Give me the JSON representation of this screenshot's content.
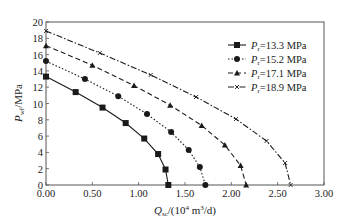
{
  "chart_data": {
    "type": "line",
    "title": "",
    "xlabel": "Q_sc /(10^4 m^3/d)",
    "xlabel_parts": {
      "main": "Q",
      "sub": "sc",
      "rest": "/(10",
      "sup1": "4",
      "mid": " m",
      "sup2": "3",
      "end": "/d)"
    },
    "ylabel": "P_wf /MPa",
    "ylabel_parts": {
      "main": "P",
      "sub": "wf",
      "rest": "/MPa"
    },
    "xlim": [
      0,
      3.0
    ],
    "ylim": [
      0,
      20
    ],
    "xticks": [
      "0.00",
      "0.50",
      "1.00",
      "1.50",
      "2.00",
      "2.50",
      "3.00"
    ],
    "xtick_values": [
      0,
      0.5,
      1.0,
      1.5,
      2.0,
      2.5,
      3.0
    ],
    "yticks": [
      "0",
      "2",
      "4",
      "6",
      "8",
      "10",
      "12",
      "14",
      "16",
      "18",
      "20"
    ],
    "ytick_values": [
      0,
      2,
      4,
      6,
      8,
      10,
      12,
      14,
      16,
      18,
      20
    ],
    "grid": false,
    "legend_position": "upper right",
    "series": [
      {
        "name": "P_r=13.3 MPa",
        "label_main": "P",
        "label_sub": "r",
        "label_rest": "=13.3 MPa",
        "marker": "square",
        "dash": "",
        "x": [
          0.0,
          0.32,
          0.61,
          0.86,
          1.06,
          1.21,
          1.29,
          1.32
        ],
        "y": [
          13.3,
          11.4,
          9.5,
          7.6,
          5.7,
          3.8,
          1.9,
          0.0
        ]
      },
      {
        "name": "P_r=15.2 MPa",
        "label_main": "P",
        "label_sub": "r",
        "label_rest": "=15.2 MPa",
        "marker": "circle",
        "dash": "1.5,2",
        "x": [
          0.0,
          0.42,
          0.78,
          1.09,
          1.35,
          1.54,
          1.66,
          1.72
        ],
        "y": [
          15.2,
          13.0,
          10.9,
          8.7,
          6.5,
          4.3,
          2.2,
          0.0
        ]
      },
      {
        "name": "P_r=17.1 MPa",
        "label_main": "P",
        "label_sub": "r",
        "label_rest": "=17.1 MPa",
        "marker": "triangle",
        "dash": "5,3",
        "x": [
          0.0,
          0.5,
          0.95,
          1.34,
          1.68,
          1.93,
          2.1,
          2.16
        ],
        "y": [
          17.1,
          14.7,
          12.2,
          9.8,
          7.3,
          4.9,
          2.4,
          0.0
        ]
      },
      {
        "name": "P_r=18.9 MPa",
        "label_main": "P",
        "label_sub": "r",
        "label_rest": "=18.9 MPa",
        "marker": "x",
        "dash": "6,2,1.5,2",
        "x": [
          0.0,
          0.58,
          1.13,
          1.62,
          2.05,
          2.38,
          2.58,
          2.64
        ],
        "y": [
          18.9,
          16.2,
          13.5,
          10.8,
          8.1,
          5.4,
          2.7,
          0.0
        ]
      }
    ]
  },
  "colors": {
    "line": "#1a1a1a",
    "axis": "#555555",
    "background": "#ffffff"
  }
}
